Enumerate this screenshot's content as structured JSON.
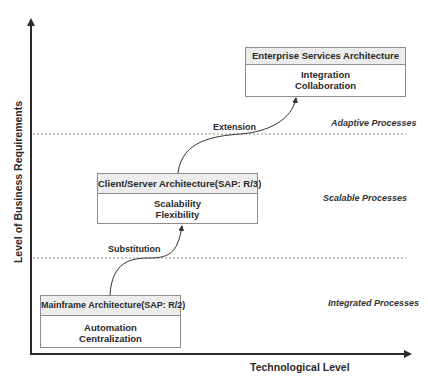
{
  "axes": {
    "x_label": "Technological Level",
    "y_label": "Level of Business Requirements"
  },
  "stages": [
    {
      "title": "Mainframe Architecture(SAP: R/2)",
      "benefits": [
        "Automation",
        "Centralization"
      ],
      "process_tier": "Integrated Processes"
    },
    {
      "title": "Client/Server Architecture(SAP: R/3)",
      "benefits": [
        "Scalability",
        "Flexibility"
      ],
      "process_tier": "Scalable Processes"
    },
    {
      "title": "Enterprise Services Architecture",
      "benefits": [
        "Integration",
        "Collaboration"
      ],
      "process_tier": "Adaptive Processes"
    }
  ],
  "transitions": [
    {
      "label": "Substitution",
      "from": 0,
      "to": 1
    },
    {
      "label": "Extension",
      "from": 1,
      "to": 2
    }
  ],
  "colors": {
    "header_fill": "#ececec",
    "border": "#8c8c8c",
    "axis": "#2a2a2a",
    "divider": "#8a8a8a"
  }
}
